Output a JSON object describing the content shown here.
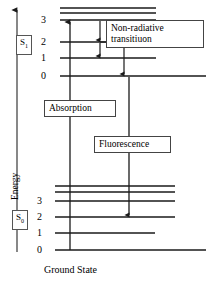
{
  "figure": {
    "type": "jablonski-energy-level-diagram",
    "axis": {
      "y_label": "Energy",
      "arrow_direction": "up"
    },
    "bottom_label": "Ground State",
    "states": [
      {
        "id": "S1",
        "name": "S",
        "subscript": "1",
        "label_full": "S1",
        "vibrational_levels": [
          "3",
          "2",
          "1",
          "0"
        ],
        "extra_unlabeled_levels": 2
      },
      {
        "id": "S0",
        "name": "S",
        "subscript": "0",
        "label_full": "S0",
        "vibrational_levels": [
          "3",
          "2",
          "1",
          "0"
        ],
        "extra_unlabeled_levels": 2
      }
    ],
    "processes": [
      {
        "id": "absorption",
        "label": "Absorption",
        "direction": "up",
        "from": "S0 v=0",
        "to": "S1 v=3"
      },
      {
        "id": "nonradiative",
        "label_line1": "Non-radiative",
        "label_line2": "transitiuon",
        "label": "Non-radiative transitiuon",
        "direction": "down",
        "steps": [
          "S1 v=3 to v=2",
          "S1 v=2 to v=1",
          "S1 v=1 to v=0"
        ]
      },
      {
        "id": "fluorescence",
        "label": "Fluorescence",
        "direction": "down",
        "from": "S1 v=0",
        "to": "S0 v=2"
      }
    ],
    "colors": {
      "line": "#1a1a1a",
      "box_border": "#444444",
      "background": "#ffffff",
      "text": "#000000"
    }
  }
}
